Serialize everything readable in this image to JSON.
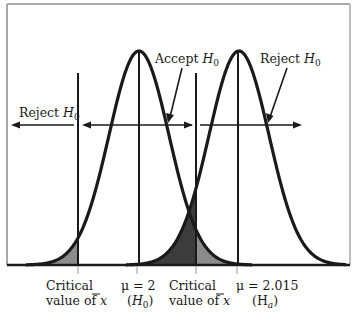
{
  "diagram": {
    "colors": {
      "line": "#1a1a1a",
      "frame": "#a8a8a8",
      "light_shade": "#8c8c8c",
      "dark_shade": "#3c3c3c",
      "background": "#ffffff"
    },
    "curves": [
      {
        "name": "H0 distribution",
        "mean_label": "μ = 2",
        "hyp_label": "(H0)",
        "peak_x": 139
      },
      {
        "name": "Ha distribution",
        "mean_label": "μ = 2.015",
        "hyp_label": "(Ha)",
        "peak_x": 239
      }
    ],
    "annotations": {
      "reject_left": {
        "text": "Reject ",
        "sub": "H",
        "idx": "0"
      },
      "accept": {
        "text": "Accept ",
        "sub": "H",
        "idx": "0"
      },
      "reject_right": {
        "text": "Reject ",
        "sub": "H",
        "idx": "0"
      }
    },
    "axis_labels": {
      "critical_left_line1": "Critical",
      "critical_left_line2": "value of ",
      "critical_left_xbar": "x",
      "mu0_line1": "μ = 2",
      "mu0_line2_open": "(",
      "mu0_line2_h": "H",
      "mu0_line2_idx": "0",
      "mu0_line2_close": ")",
      "critical_right_line1": "Critical",
      "critical_right_line2": "value of ",
      "critical_right_xbar": "x",
      "mua_line1": "μ = 2.015",
      "mua_line2_open": "(H",
      "mua_line2_idx": "a",
      "mua_line2_close": ")"
    }
  }
}
